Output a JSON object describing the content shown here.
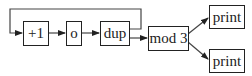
{
  "diagram": {
    "nodes": [
      {
        "id": "inc",
        "label": "+1"
      },
      {
        "id": "compose",
        "label": "o"
      },
      {
        "id": "dup",
        "label": "dup"
      },
      {
        "id": "mod",
        "label": "mod 3"
      },
      {
        "id": "print1",
        "label": "print"
      },
      {
        "id": "print2",
        "label": "print"
      }
    ],
    "edges": [
      {
        "from": "inc",
        "to": "compose"
      },
      {
        "from": "compose",
        "to": "dup"
      },
      {
        "from": "dup",
        "to": "mod"
      },
      {
        "from": "dup",
        "to": "inc",
        "type": "feedback-loop"
      },
      {
        "from": "mod",
        "to": "print1"
      },
      {
        "from": "mod",
        "to": "print2"
      }
    ],
    "colors": {
      "stroke": "#222222",
      "background": "#ffffff"
    }
  }
}
